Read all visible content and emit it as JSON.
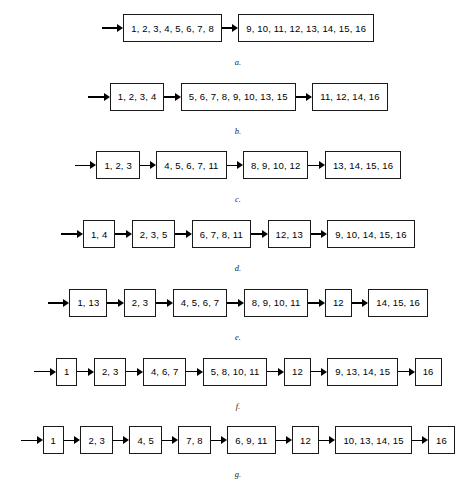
{
  "figure": {
    "title": "",
    "background_color": "#ffffff",
    "line_color": "#000000",
    "rows": [
      {
        "label": "a.",
        "boxes": [
          "1, 2, 3, 4, 5, 6, 7, 8",
          "9, 10, 11, 12, 13, 14, 15, 16"
        ]
      },
      {
        "label": "b.",
        "boxes": [
          "1, 2, 3, 4",
          "5, 6, 7, 8, 9, 10, 13, 15",
          "11, 12, 14, 16"
        ]
      },
      {
        "label": "c.",
        "boxes": [
          "1, 2, 3",
          "4, 5, 6, 7, 11",
          "8, 9, 10, 12",
          "13, 14, 15, 16"
        ]
      },
      {
        "label": "d.",
        "boxes": [
          "1, 4",
          "2, 3, 5",
          "6, 7, 8, 11",
          "12, 13",
          "9, 10, 14, 15, 16"
        ]
      },
      {
        "label": "e.",
        "boxes": [
          "1, 13",
          "2, 3",
          "4, 5, 6, 7",
          "8, 9, 10, 11",
          "12",
          "14, 15, 16"
        ]
      },
      {
        "label": "f.",
        "boxes": [
          "1",
          "2, 3",
          "4, 6, 7",
          "5, 8, 10, 11",
          "12",
          "9, 13, 14, 15",
          "16"
        ]
      },
      {
        "label": "g.",
        "boxes": [
          "1",
          "2, 3",
          "4, 5",
          "7, 8",
          "6, 9, 11",
          "12",
          "10, 13, 14, 15",
          "16"
        ]
      }
    ]
  }
}
